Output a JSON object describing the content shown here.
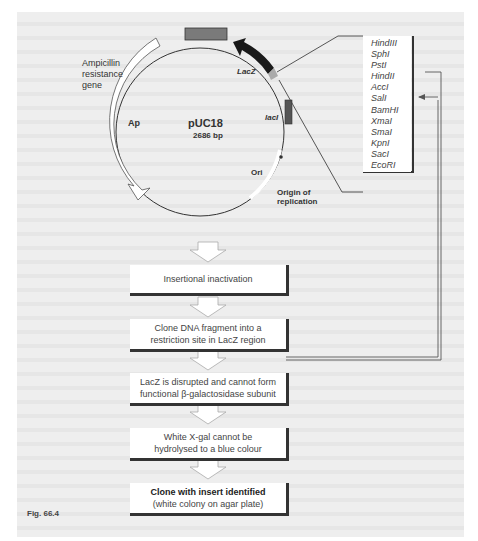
{
  "plasmid": {
    "name": "pUC18",
    "size": "2686 bp",
    "labels": {
      "ampicillin": [
        "Ampicillin",
        "resistance",
        "gene"
      ],
      "ap": "Ap",
      "lacz": "LacZ",
      "laci": "lacI",
      "ori": "Ori",
      "origin": [
        "Origin of",
        "replication"
      ]
    }
  },
  "restriction_sites": [
    "HindIII",
    "SphI",
    "PstI",
    "HindII",
    "AccI",
    "SalI",
    "BamHI",
    "XmaI",
    "SmaI",
    "KpnI",
    "SacI",
    "EcoRI"
  ],
  "flow_steps": [
    {
      "line1": "Insertional inactivation",
      "line2": ""
    },
    {
      "line1": "Clone DNA fragment into a",
      "line2": "restriction site in LacZ region"
    },
    {
      "line1": "LacZ is disrupted and cannot form",
      "line2": "functional β-galactosidase subunit"
    },
    {
      "line1": "White X-gal cannot be",
      "line2": "hydrolysed to a blue colour"
    },
    {
      "line1": "Clone with insert identified",
      "line2": "(white colony on agar plate)"
    }
  ],
  "figure_label": "Fig. 66.4",
  "colors": {
    "page": "#eeeeee",
    "box": "#ffffff",
    "ink": "#333333",
    "lacz": "#1a1a1a",
    "laci": "#555555",
    "top_gene": "#7a7a7a",
    "mcs": "#aaaaaa"
  }
}
